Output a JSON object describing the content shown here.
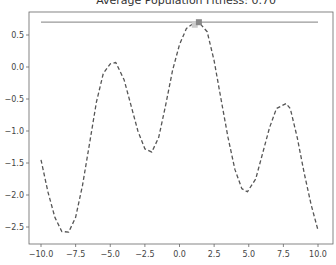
{
  "chart_data": {
    "type": "line",
    "title": "Average Population Fitness: 0.70",
    "xlabel": "",
    "ylabel": "",
    "xlim": [
      -11,
      10.9
    ],
    "ylim": [
      -2.75,
      0.85
    ],
    "grid": false,
    "x_ticks": [
      "−10.0",
      "−7.5",
      "−5.0",
      "−2.5",
      "0.0",
      "2.5",
      "5.0",
      "7.5",
      "10.0"
    ],
    "y_ticks": [
      "0.5",
      "0.0",
      "−0.5",
      "−1.0",
      "−1.5",
      "−2.0",
      "−2.5"
    ],
    "series": [
      {
        "name": "fitness function",
        "style": "dashed",
        "color": "#555555",
        "x": [
          -10,
          -9.5,
          -9,
          -8.5,
          -8,
          -7.5,
          -7,
          -6.5,
          -6,
          -5.5,
          -5,
          -4.6,
          -4,
          -3.5,
          -3,
          -2.5,
          -2,
          -1.5,
          -1,
          -0.5,
          0,
          0.5,
          1,
          1.4,
          2,
          2.5,
          3,
          3.5,
          4,
          4.5,
          4.9,
          5.5,
          6,
          6.5,
          7,
          7.7,
          8,
          8.5,
          9,
          9.5,
          10
        ],
        "y": [
          -1.45,
          -1.95,
          -2.35,
          -2.57,
          -2.58,
          -2.35,
          -1.85,
          -1.2,
          -0.55,
          -0.1,
          0.05,
          0.07,
          -0.2,
          -0.6,
          -1.0,
          -1.28,
          -1.33,
          -1.1,
          -0.6,
          -0.05,
          0.35,
          0.6,
          0.68,
          0.7,
          0.55,
          0.1,
          -0.5,
          -1.1,
          -1.6,
          -1.9,
          -1.95,
          -1.75,
          -1.35,
          -0.95,
          -0.65,
          -0.57,
          -0.65,
          -1.1,
          -1.65,
          -2.15,
          -2.55
        ]
      },
      {
        "name": "average fitness line",
        "style": "solid",
        "color": "#999999",
        "x": [
          -10,
          10
        ],
        "y": [
          0.7,
          0.7
        ]
      }
    ],
    "markers": [
      {
        "x": 1.4,
        "y": 0.7,
        "color": "#888888",
        "shape": "square"
      },
      {
        "x": 1.1,
        "y": 0.66,
        "color": "#cccccc",
        "shape": "square"
      }
    ]
  }
}
